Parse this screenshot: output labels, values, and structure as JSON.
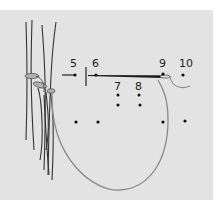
{
  "diagram": {
    "type": "stitching-instruction",
    "background_color": "#e3e3e3",
    "ink_color": "#1a1a1a",
    "thread_color": "#8a8a8a",
    "labels": [
      {
        "id": "5",
        "text": "5"
      },
      {
        "id": "6",
        "text": "6"
      },
      {
        "id": "7",
        "text": "7"
      },
      {
        "id": "8",
        "text": "8"
      },
      {
        "id": "9",
        "text": "9"
      },
      {
        "id": "10",
        "text": "10"
      }
    ]
  }
}
